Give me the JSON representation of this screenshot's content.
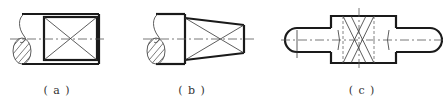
{
  "figures": [
    {
      "id": "a",
      "label": "( a )",
      "description": "Cylindrical shaft end with knurled/marked rectangular region"
    },
    {
      "id": "b",
      "label": "( b )",
      "description": "Shaft end with tapered (conical) region"
    },
    {
      "id": "c",
      "label": "( c )",
      "description": "Stepped shaft with central raised collar region"
    }
  ],
  "colors": {
    "line": "#1a1a1a",
    "thin_line": "#333333",
    "background": "#ffffff"
  }
}
